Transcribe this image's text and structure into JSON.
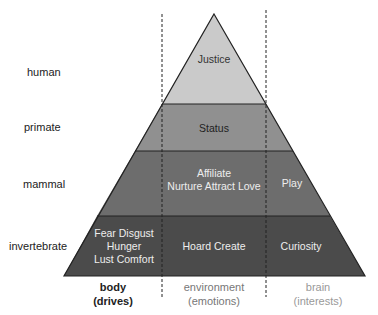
{
  "rows": [
    {
      "label": "human",
      "cells": [
        "Justice"
      ]
    },
    {
      "label": "primate",
      "cells": [
        "Status"
      ]
    },
    {
      "label": "mammal",
      "cells": [
        "Affiliate\nNurture Attract Love",
        "Play"
      ]
    },
    {
      "label": "invertebrate",
      "cells": [
        "Fear Disgust\nHunger\nLust Comfort",
        "Hoard Create",
        "Curiosity"
      ]
    }
  ],
  "columns": [
    {
      "name": "body",
      "sub": "(drives)"
    },
    {
      "name": "environment",
      "sub": "(emotions)"
    },
    {
      "name": "brain",
      "sub": "(interests)"
    }
  ],
  "colors": {
    "human": "#c9c9c9",
    "primate": "#8f8f8f",
    "mammal": "#6a6a6a",
    "invertebrate": "#4a4a4a"
  }
}
